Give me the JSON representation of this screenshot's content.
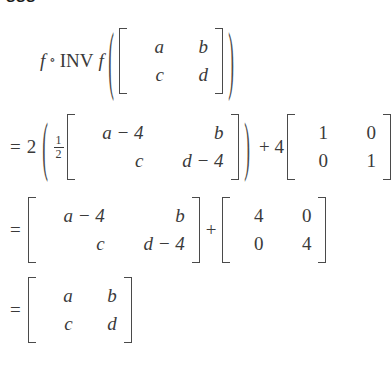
{
  "cropped_header": {
    "text": "sss"
  },
  "derivation": {
    "symbols": {
      "equals": "=",
      "plus": "+",
      "ring": "∘",
      "minus": "−",
      "open_paren": "(",
      "close_paren": ")"
    },
    "line1": {
      "f_left": "f",
      "ring": "∘",
      "inv": "INV",
      "f_right": "f",
      "matrix": {
        "rows": [
          [
            "a",
            "b"
          ],
          [
            "c",
            "d"
          ]
        ]
      }
    },
    "line2": {
      "relation": "=",
      "scalar": "2",
      "fraction": {
        "numerator": "1",
        "denominator": "2"
      },
      "matrix_a": {
        "rows": [
          [
            "a − 4",
            "b"
          ],
          [
            "c",
            "d − 4"
          ]
        ]
      },
      "operator": "+",
      "scalar_2": "4",
      "matrix_b": {
        "rows": [
          [
            "1",
            "0"
          ],
          [
            "0",
            "1"
          ]
        ]
      }
    },
    "line3": {
      "relation": "=",
      "matrix_a": {
        "rows": [
          [
            "a − 4",
            "b"
          ],
          [
            "c",
            "d − 4"
          ]
        ]
      },
      "operator": "+",
      "matrix_b": {
        "rows": [
          [
            "4",
            "0"
          ],
          [
            "0",
            "4"
          ]
        ]
      }
    },
    "line4": {
      "relation": "=",
      "matrix": {
        "rows": [
          [
            "a",
            "b"
          ],
          [
            "c",
            "d"
          ]
        ]
      }
    }
  },
  "colors": {
    "background": "#ffffff",
    "text": "#3a3a3a",
    "delimiter": "#4a4a4a",
    "header_text": "#1a1a1a"
  }
}
